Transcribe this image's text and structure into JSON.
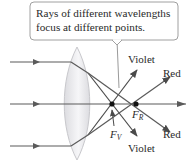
{
  "callout": {
    "line1": "Rays of different wavelengths",
    "line2": "focus at different points."
  },
  "labels": {
    "violet_top": "Violet",
    "red_top": "Red",
    "red_bottom": "Red",
    "violet_bottom": "Violet"
  },
  "focal_points": {
    "violet": {
      "main": "F",
      "sub": "V"
    },
    "red": {
      "main": "F",
      "sub": "R"
    }
  },
  "colors": {
    "ray": "#5a5a5a",
    "lens_fill": "#e8e8ea",
    "lens_stroke": "#c8c8cc",
    "callout_stroke": "#9a9a9a",
    "dot": "#111111"
  }
}
